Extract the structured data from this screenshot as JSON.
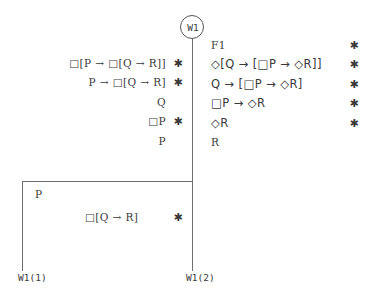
{
  "diagram": {
    "type": "modal-logic-tableau",
    "root_node": {
      "label": "W1"
    },
    "left_branch": {
      "formulas": [
        {
          "text": "□[P → □[Q → R]]",
          "marked": true
        },
        {
          "text": "P → □[Q → R]",
          "marked": true
        },
        {
          "text": "Q",
          "marked": false
        },
        {
          "text": "□P",
          "marked": true
        },
        {
          "text": "P",
          "marked": false
        }
      ],
      "sub_branch": {
        "assumption": "P",
        "formulas": [
          {
            "text": "□[Q → R]",
            "marked": true
          }
        ]
      },
      "leaf_label": "W1(1)"
    },
    "right_branch": {
      "formulas": [
        {
          "text": "F1",
          "marked": true
        },
        {
          "text": "◇[Q → [□P → ◇R]]",
          "marked": true
        },
        {
          "text": "Q → [□P → ◇R]",
          "marked": true
        },
        {
          "text": "□P → ◇R",
          "marked": true
        },
        {
          "text": "◇R",
          "marked": true
        },
        {
          "text": "R",
          "marked": false
        }
      ],
      "leaf_label": "W1(2)"
    },
    "mark_glyph": "✱",
    "colors": {
      "background": "#ffffff",
      "line": "#6e6e6e",
      "text": "#3a3a3a",
      "node_border": "#555555"
    }
  }
}
